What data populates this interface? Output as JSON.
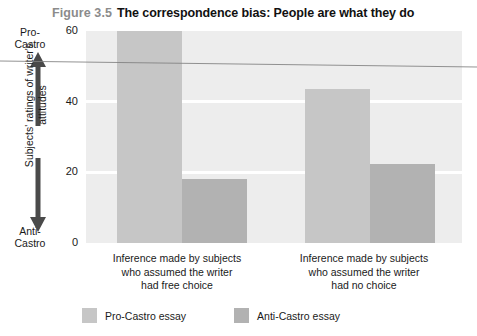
{
  "figure": {
    "number": "Figure 3.5",
    "title": "The correspondence bias: People are what they do"
  },
  "axis": {
    "y_label": "Subjects' ratings of writer's attitudes",
    "pole_high_line1": "Pro-",
    "pole_high_line2": "Castro",
    "pole_low_line1": "Anti-",
    "pole_low_line2": "Castro",
    "ticks": [
      "60",
      "40",
      "20",
      "0"
    ],
    "up_arrow_icon": "up-arrow-icon",
    "down_arrow_icon": "down-arrow-icon"
  },
  "legend": {
    "items": [
      {
        "label": "Pro-Castro essay",
        "color": "#c6c6c6"
      },
      {
        "label": "Anti-Castro essay",
        "color": "#b2b2b2"
      }
    ]
  },
  "categories_multiline": [
    [
      "Inference made by subjects",
      "who assumed the writer",
      "had free choice"
    ],
    [
      "Inference made by subjects",
      "who assumed the writer",
      "had no choice"
    ]
  ],
  "chart_data": {
    "type": "bar",
    "title": "The correspondence bias: People are what they do",
    "xlabel": "",
    "ylabel": "Subjects' ratings of writer's attitudes",
    "ylim": [
      0,
      60
    ],
    "yticks": [
      0,
      20,
      40,
      60
    ],
    "grid": true,
    "grid_color": "#ffffff",
    "plot_background": "#ededed",
    "legend_position": "bottom",
    "categories": [
      "Inference made by subjects who assumed the writer had free choice",
      "Inference made by subjects who assumed the writer had no choice"
    ],
    "series": [
      {
        "name": "Pro-Castro essay",
        "color": "#c6c6c6",
        "values": [
          60,
          43.5
        ]
      },
      {
        "name": "Anti-Castro essay",
        "color": "#b2b2b2",
        "values": [
          18,
          22.5
        ]
      }
    ],
    "annotations": [
      "Pro-Castro (top of scale)",
      "Anti-Castro (bottom of scale)"
    ]
  }
}
